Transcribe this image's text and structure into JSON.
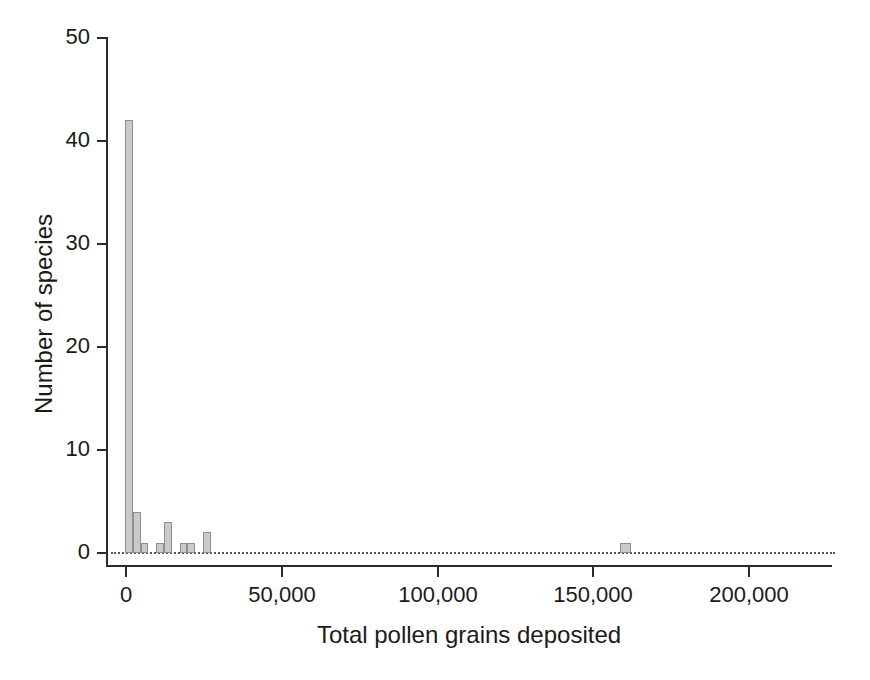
{
  "chart_data": {
    "type": "bar",
    "title": "",
    "subtitle": "",
    "xlabel": "Total pollen grains deposited",
    "ylabel": "Number of species",
    "xlim": [
      -5000,
      227000
    ],
    "ylim": [
      0,
      50
    ],
    "grid": false,
    "legend": null,
    "annotations": [],
    "bin_width": 5000,
    "x_ticks": [
      0,
      50000,
      100000,
      150000,
      200000
    ],
    "x_tick_labels": [
      "0",
      "50,000",
      "100,000",
      "150,000",
      "200,000"
    ],
    "y_ticks": [
      0,
      10,
      20,
      30,
      40,
      50
    ],
    "y_tick_labels": [
      "0",
      "10",
      "20",
      "30",
      "40",
      "50"
    ],
    "bars": [
      {
        "bin_start": 0,
        "bin_end": 2500,
        "x_center": 1250,
        "value": 42
      },
      {
        "bin_start": 2500,
        "bin_end": 5000,
        "x_center": 3750,
        "value": 4
      },
      {
        "bin_start": 5000,
        "bin_end": 7500,
        "x_center": 6250,
        "value": 1
      },
      {
        "bin_start": 10000,
        "bin_end": 12500,
        "x_center": 11250,
        "value": 1
      },
      {
        "bin_start": 12500,
        "bin_end": 15000,
        "x_center": 13750,
        "value": 3
      },
      {
        "bin_start": 17500,
        "bin_end": 20000,
        "x_center": 18750,
        "value": 1
      },
      {
        "bin_start": 20000,
        "bin_end": 22500,
        "x_center": 21250,
        "value": 1
      },
      {
        "bin_start": 25000,
        "bin_end": 27500,
        "x_center": 26250,
        "value": 2
      },
      {
        "bin_start": 159000,
        "bin_end": 162500,
        "x_center": 160750,
        "value": 1
      }
    ],
    "categories": [
      "1,250",
      "3,750",
      "6,250",
      "11,250",
      "13,750",
      "18,750",
      "21,250",
      "26,250",
      "160,750"
    ],
    "values": [
      42,
      4,
      1,
      1,
      3,
      1,
      1,
      2,
      1
    ],
    "colors": {
      "bar_fill": "#c9c9c9",
      "bar_edge": "#8e8e8e",
      "axis": "#2b2b2b",
      "baseline": "#555555",
      "text": "#1a1a1a",
      "background": "#ffffff"
    }
  }
}
